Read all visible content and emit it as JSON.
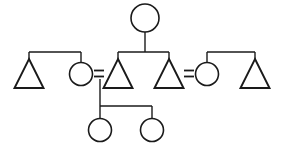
{
  "diagram": {
    "type": "kinship-chart",
    "title": "",
    "canvas": {
      "width": 284,
      "height": 157
    },
    "background_color": "#ffffff",
    "line_color": "#1a1a1a",
    "symbol_legend": {
      "triangle": "male",
      "circle": "female",
      "equals": "marriage-union",
      "vertical-line": "descent",
      "horizontal-bar": "sibling-link"
    },
    "persons": [
      {
        "id": "p1",
        "symbol": "circle",
        "sex": "female",
        "generation": 1,
        "label": "",
        "cx": 145,
        "cy": 18,
        "r": 14
      },
      {
        "id": "p2",
        "symbol": "triangle",
        "sex": "male",
        "generation": 2,
        "label": "",
        "cx": 29,
        "cy": 74,
        "size": 15
      },
      {
        "id": "p3",
        "symbol": "circle",
        "sex": "female",
        "generation": 2,
        "label": "",
        "cx": 81,
        "cy": 74,
        "r": 11.5
      },
      {
        "id": "p4",
        "symbol": "triangle",
        "sex": "male",
        "generation": 2,
        "label": "",
        "cx": 118,
        "cy": 74,
        "size": 15
      },
      {
        "id": "p5",
        "symbol": "triangle",
        "sex": "male",
        "generation": 2,
        "label": "",
        "cx": 169,
        "cy": 74,
        "size": 15
      },
      {
        "id": "p6",
        "symbol": "circle",
        "sex": "female",
        "generation": 2,
        "label": "",
        "cx": 207,
        "cy": 74,
        "r": 11.5
      },
      {
        "id": "p7",
        "symbol": "triangle",
        "sex": "male",
        "generation": 2,
        "label": "",
        "cx": 255,
        "cy": 74,
        "size": 15
      },
      {
        "id": "p8",
        "symbol": "circle",
        "sex": "female",
        "generation": 3,
        "label": "",
        "cx": 100,
        "cy": 130,
        "r": 11.5
      },
      {
        "id": "p9",
        "symbol": "circle",
        "sex": "female",
        "generation": 3,
        "label": "",
        "cx": 152,
        "cy": 130,
        "r": 11.5
      }
    ],
    "unions": [
      {
        "id": "u1",
        "symbol": "equals",
        "spouse_a": "p3",
        "spouse_b": "p4",
        "x": 99,
        "y": 74,
        "children": [
          "p8",
          "p9"
        ]
      },
      {
        "id": "u2",
        "symbol": "equals",
        "spouse_a": "p5",
        "spouse_b": "p6",
        "x": 189,
        "y": 74,
        "children": []
      }
    ],
    "sibling_groups": [
      {
        "id": "s1",
        "members": [
          "p2",
          "p3"
        ],
        "bar_y": 52,
        "bar_x1": 29,
        "bar_x2": 81,
        "parent": ""
      },
      {
        "id": "s2",
        "members": [
          "p4",
          "p5"
        ],
        "bar_y": 52,
        "bar_x1": 118,
        "bar_x2": 169,
        "parent": "p1"
      },
      {
        "id": "s3",
        "members": [
          "p6",
          "p7"
        ],
        "bar_y": 52,
        "bar_x1": 207,
        "bar_x2": 255,
        "parent": ""
      },
      {
        "id": "s4",
        "members": [
          "p8",
          "p9"
        ],
        "bar_y": 106,
        "bar_x1": 100,
        "bar_x2": 152,
        "parent": "u1"
      }
    ],
    "descent_lines": [
      {
        "id": "d1",
        "from": "p1",
        "to": "s2",
        "x": 145,
        "y1": 32,
        "y2": 52
      },
      {
        "id": "d2",
        "from": "u1",
        "to": "s4",
        "x": 100,
        "y1": 80,
        "y2": 106
      }
    ]
  }
}
